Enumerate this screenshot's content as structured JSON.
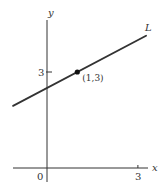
{
  "chart_data": {
    "type": "line",
    "title": "",
    "xlabel": "x",
    "ylabel": "y",
    "xlim": [
      -1.12,
      3.4
    ],
    "ylim": [
      -0.6,
      4.7
    ],
    "grid": false,
    "x_ticks": [
      {
        "value": 3,
        "label": "3"
      }
    ],
    "y_ticks": [
      {
        "value": 3,
        "label": "3"
      }
    ],
    "origin_label": "0",
    "series": [
      {
        "name": "L",
        "label": "L",
        "slope": 0.5,
        "intercept": 2.5,
        "x": [
          -1.12,
          3.27
        ],
        "y": [
          1.94,
          4.135
        ]
      }
    ],
    "points": [
      {
        "x": 1,
        "y": 3,
        "label": "(1,3)"
      }
    ],
    "colors": {
      "line": "#333333",
      "axes": "#333333",
      "text": "#333333"
    }
  }
}
